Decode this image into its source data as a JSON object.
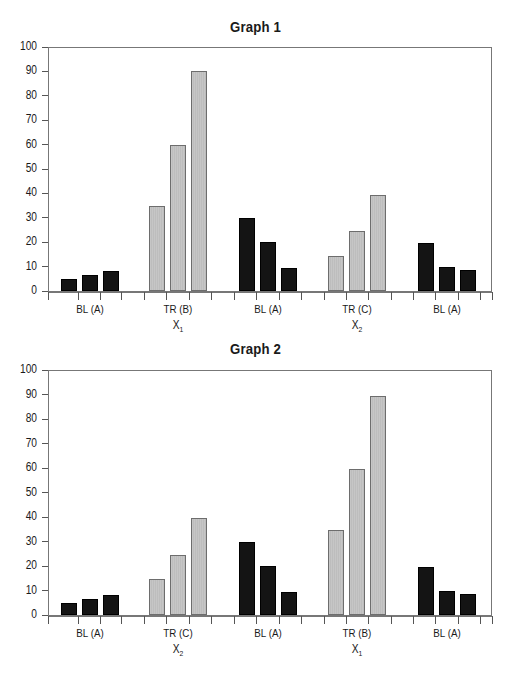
{
  "chart_data": [
    {
      "type": "bar",
      "title": "Graph 1",
      "xlabel": "",
      "ylabel": "",
      "ylim": [
        0,
        100
      ],
      "yticks": [
        0,
        10,
        20,
        30,
        40,
        50,
        60,
        70,
        80,
        90,
        100
      ],
      "grid": false,
      "legend": null,
      "categories": [
        {
          "label": "BL (A)",
          "sublabel": ""
        },
        {
          "label": "TR (B)",
          "sublabel": "X",
          "subscript": "1"
        },
        {
          "label": "BL (A)",
          "sublabel": ""
        },
        {
          "label": "TR (C)",
          "sublabel": "X",
          "subscript": "2"
        },
        {
          "label": "BL (A)",
          "sublabel": ""
        }
      ],
      "groups": [
        {
          "phase": "baseline",
          "color": "dark",
          "values": [
            5,
            6.5,
            8
          ]
        },
        {
          "phase": "treatment",
          "color": "light",
          "values": [
            35,
            60,
            90
          ]
        },
        {
          "phase": "baseline",
          "color": "dark",
          "values": [
            30,
            20,
            9.5
          ]
        },
        {
          "phase": "treatment",
          "color": "light",
          "values": [
            14.5,
            24.5,
            39.5
          ]
        },
        {
          "phase": "baseline",
          "color": "dark",
          "values": [
            19.5,
            10,
            8.5
          ]
        }
      ]
    },
    {
      "type": "bar",
      "title": "Graph 2",
      "xlabel": "",
      "ylabel": "",
      "ylim": [
        0,
        100
      ],
      "yticks": [
        0,
        10,
        20,
        30,
        40,
        50,
        60,
        70,
        80,
        90,
        100
      ],
      "grid": false,
      "legend": null,
      "categories": [
        {
          "label": "BL (A)",
          "sublabel": ""
        },
        {
          "label": "TR (C)",
          "sublabel": "X",
          "subscript": "2"
        },
        {
          "label": "BL (A)",
          "sublabel": ""
        },
        {
          "label": "TR (B)",
          "sublabel": "X",
          "subscript": "1"
        },
        {
          "label": "BL (A)",
          "sublabel": ""
        }
      ],
      "groups": [
        {
          "phase": "baseline",
          "color": "dark",
          "values": [
            5,
            6.5,
            8
          ]
        },
        {
          "phase": "treatment",
          "color": "light",
          "values": [
            14.5,
            24.5,
            39.5
          ]
        },
        {
          "phase": "baseline",
          "color": "dark",
          "values": [
            30,
            20,
            9.5
          ]
        },
        {
          "phase": "treatment",
          "color": "light",
          "values": [
            34.5,
            59.5,
            89.5
          ]
        },
        {
          "phase": "baseline",
          "color": "dark",
          "values": [
            19.5,
            10,
            8.5
          ]
        }
      ]
    }
  ],
  "colors": {
    "baseline_bar": "#141414",
    "treatment_bar": "#c2c2c2",
    "axis": "#777777"
  }
}
